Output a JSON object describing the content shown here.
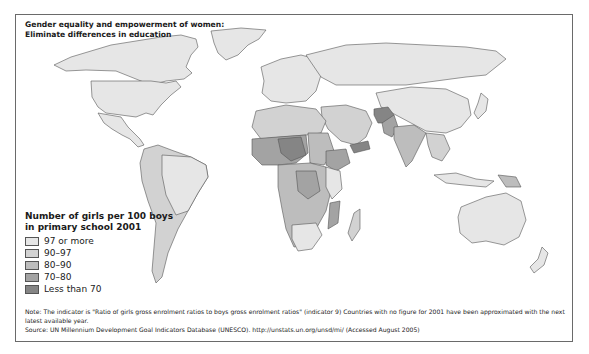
{
  "title": {
    "line1": "Gender equality and empowerment of women:",
    "line2": "Eliminate differences in education"
  },
  "legend": {
    "title_line1": "Number of girls per 100 boys",
    "title_line2": "in primary school 2001",
    "items": [
      {
        "label": "97 or more",
        "color": "#e6e6e6"
      },
      {
        "label": "90–97",
        "color": "#d2d2d2"
      },
      {
        "label": "80–90",
        "color": "#bdbdbd"
      },
      {
        "label": "70–80",
        "color": "#a3a3a3"
      },
      {
        "label": "Less than 70",
        "color": "#858585"
      }
    ]
  },
  "notes": {
    "note": "Note: The indicator is \"Ratio of girls gross enrolment ratios to boys gross enrolment ratios\" (indicator 9) Countries with no figure for 2001 have been approximated with the next latest available year.",
    "source": "Source: UN Millennium Development Goal Indicators Database (UNESCO). http://unstats.un.org/unsd/mi/ (Accessed August 2005)"
  },
  "colors": {
    "border": "#6a6a6a",
    "outline": "#555555",
    "ocean": "#ffffff"
  }
}
